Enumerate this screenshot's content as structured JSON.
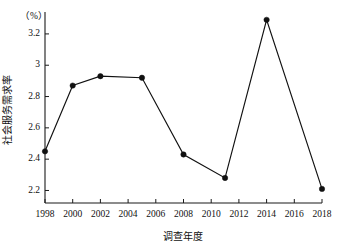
{
  "chart_data": {
    "type": "line",
    "title": "",
    "xlabel": "调查年度",
    "ylabel": "社会服务需求率",
    "unit_label": "（%）",
    "x": [
      1998,
      2000,
      2002,
      2005,
      2008,
      2011,
      2014,
      2018
    ],
    "values": [
      2.45,
      2.87,
      2.93,
      2.92,
      2.43,
      2.28,
      3.29,
      2.21
    ],
    "series": [
      {
        "name": "社会服务需求率",
        "values": [
          2.45,
          2.87,
          2.93,
          2.92,
          2.43,
          2.28,
          3.29,
          2.21
        ]
      }
    ],
    "points": [
      {
        "x": 1998,
        "y": 2.45
      },
      {
        "x": 2000,
        "y": 2.87
      },
      {
        "x": 2002,
        "y": 2.93
      },
      {
        "x": 2005,
        "y": 2.92
      },
      {
        "x": 2008,
        "y": 2.43
      },
      {
        "x": 2011,
        "y": 2.28
      },
      {
        "x": 2014,
        "y": 3.29
      },
      {
        "x": 2018,
        "y": 2.21
      }
    ],
    "xlim": [
      1998,
      2018
    ],
    "ylim": [
      2.12,
      3.34
    ],
    "xticks": [
      1998,
      2000,
      2002,
      2004,
      2006,
      2008,
      2010,
      2012,
      2014,
      2016,
      2018
    ],
    "xtick_labels": [
      "1998",
      "2000",
      "2002",
      "2004",
      "2006",
      "2008",
      "2010",
      "2012",
      "2014",
      "2016",
      "2018"
    ],
    "yticks": [
      2.2,
      2.4,
      2.6,
      2.8,
      3.0,
      3.2
    ],
    "ytick_labels": [
      "2.2",
      "2.4",
      "2.6",
      "2.8",
      "3",
      "3.2"
    ],
    "grid": false,
    "legend": false,
    "legend_position": "none",
    "marker": "filled-circle",
    "line_color": "#111111",
    "marker_color": "#111111",
    "background_color": "#ffffff"
  }
}
